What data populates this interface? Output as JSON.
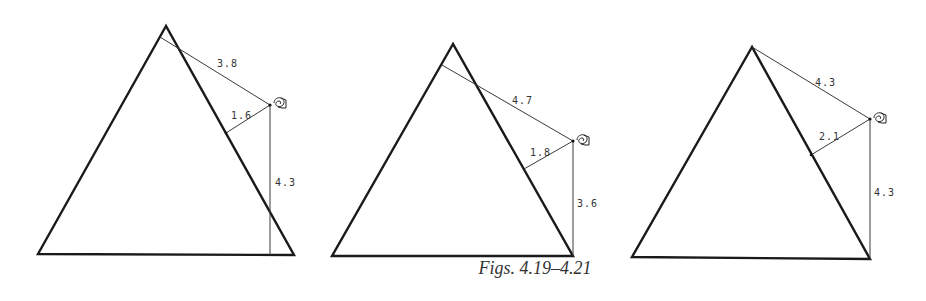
{
  "caption": "Figs. 4.19–4.21",
  "figures": [
    {
      "id": "4.19",
      "triangle": {
        "apex": [
          166,
          26
        ],
        "bottom_left": [
          38,
          254
        ],
        "bottom_right": [
          294,
          255
        ]
      },
      "point": [
        270,
        105
      ],
      "segments": [
        {
          "name": "slant-to-left-side",
          "from": [
            270,
            105
          ],
          "to": [
            160,
            37
          ],
          "label": "3.8",
          "label_pos": [
            217,
            67
          ]
        },
        {
          "name": "perpendicular-to-right-side",
          "from": [
            270,
            105
          ],
          "to": [
            226,
            133
          ],
          "label": "1.6",
          "label_pos": [
            231,
            119
          ]
        },
        {
          "name": "vertical-to-base",
          "from": [
            270,
            105
          ],
          "to": [
            270,
            255
          ],
          "label": "4.3",
          "label_pos": [
            275,
            186
          ]
        }
      ]
    },
    {
      "id": "4.20",
      "triangle": {
        "apex": [
          453,
          44
        ],
        "bottom_left": [
          332,
          256
        ],
        "bottom_right": [
          573,
          256
        ]
      },
      "point": [
        573,
        141
      ],
      "segments": [
        {
          "name": "slant-to-left-side",
          "from": [
            573,
            141
          ],
          "to": [
            442,
            65
          ],
          "label": "4.7",
          "label_pos": [
            512,
            104
          ]
        },
        {
          "name": "perpendicular-to-right-side",
          "from": [
            573,
            141
          ],
          "to": [
            524,
            169
          ],
          "label": "1.8",
          "label_pos": [
            530,
            156
          ]
        },
        {
          "name": "vertical-to-base",
          "from": [
            573,
            141
          ],
          "to": [
            573,
            256
          ],
          "label": "3.6",
          "label_pos": [
            577,
            207
          ]
        }
      ]
    },
    {
      "id": "4.21",
      "triangle": {
        "apex": [
          752,
          47
        ],
        "bottom_left": [
          632,
          257
        ],
        "bottom_right": [
          870,
          259
        ]
      },
      "point": [
        870,
        119
      ],
      "segments": [
        {
          "name": "slant-to-apex",
          "from": [
            870,
            119
          ],
          "to": [
            752,
            47
          ],
          "label": "4.3",
          "label_pos": [
            815,
            86
          ]
        },
        {
          "name": "perpendicular-to-right-side",
          "from": [
            870,
            119
          ],
          "to": [
            811,
            155
          ],
          "label": "2.1",
          "label_pos": [
            819,
            140
          ]
        },
        {
          "name": "vertical-to-base",
          "from": [
            870,
            119
          ],
          "to": [
            870,
            259
          ],
          "label": "4.3",
          "label_pos": [
            874,
            196
          ]
        }
      ]
    }
  ]
}
